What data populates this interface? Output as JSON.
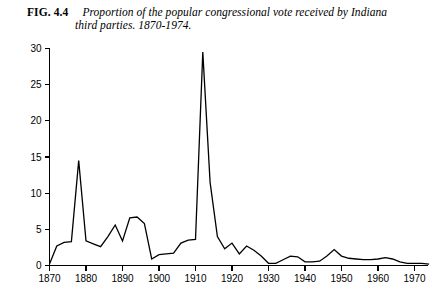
{
  "figure": {
    "label": "FIG. 4.4",
    "caption_line1": "Proportion of the popular congressional vote received by Indiana",
    "caption_line2": "third parties. 1870-1974."
  },
  "chart_data": {
    "type": "line",
    "title": "Proportion of the popular congressional vote received by Indiana third parties. 1870-1974.",
    "xlabel": "",
    "ylabel": "",
    "xlim": [
      1870,
      1970
    ],
    "ylim": [
      0,
      30
    ],
    "xticks": [
      1870,
      1880,
      1890,
      1900,
      1910,
      1920,
      1930,
      1940,
      1950,
      1960,
      1970
    ],
    "yticks": [
      0,
      5,
      10,
      15,
      20,
      25,
      30
    ],
    "grid": false,
    "legend": false,
    "line_color": "#000000",
    "series": [
      {
        "name": "Indiana third-party share of congressional vote (%)",
        "x": [
          1870,
          1872,
          1874,
          1876,
          1878,
          1880,
          1882,
          1884,
          1886,
          1888,
          1890,
          1892,
          1894,
          1896,
          1898,
          1900,
          1902,
          1904,
          1906,
          1908,
          1910,
          1912,
          1914,
          1916,
          1918,
          1920,
          1922,
          1924,
          1926,
          1928,
          1930,
          1932,
          1934,
          1936,
          1938,
          1940,
          1942,
          1944,
          1946,
          1948,
          1950,
          1952,
          1954,
          1956,
          1958,
          1960,
          1962,
          1964,
          1966,
          1968,
          1970,
          1972,
          1974
        ],
        "values": [
          0.2,
          2.7,
          3.2,
          3.3,
          14.5,
          3.4,
          3.0,
          2.6,
          4.0,
          5.6,
          3.4,
          6.6,
          6.7,
          5.8,
          0.9,
          1.5,
          1.6,
          1.7,
          3.1,
          3.5,
          3.6,
          29.5,
          11.5,
          4.0,
          2.3,
          3.1,
          1.6,
          2.7,
          2.1,
          1.3,
          0.3,
          0.3,
          0.8,
          1.3,
          1.2,
          0.5,
          0.5,
          0.6,
          1.3,
          2.2,
          1.3,
          1.0,
          0.9,
          0.8,
          0.8,
          0.9,
          1.1,
          0.9,
          0.5,
          0.3,
          0.3,
          0.3,
          0.2
        ]
      }
    ],
    "annotations": {
      "peak_1878": 14.5,
      "peak_1912": 29.5
    }
  }
}
